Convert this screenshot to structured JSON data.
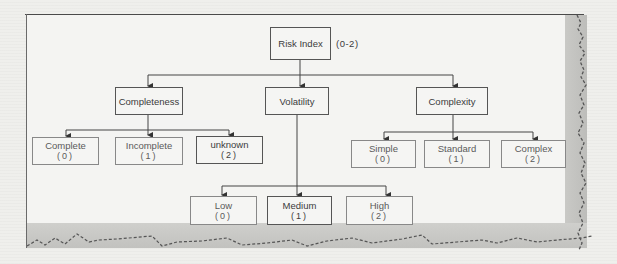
{
  "diagram": {
    "root": {
      "label": "Risk Index",
      "range": "(0-2)"
    },
    "categories": [
      {
        "label": "Completeness",
        "children": [
          {
            "label": "Complete",
            "value": "(0)"
          },
          {
            "label": "Incomplete",
            "value": "(1)"
          },
          {
            "label": "unknown",
            "value": "(2)"
          }
        ]
      },
      {
        "label": "Volatility",
        "children": [
          {
            "label": "Low",
            "value": "(0)"
          },
          {
            "label": "Medium",
            "value": "(1)"
          },
          {
            "label": "High",
            "value": "(2)"
          }
        ]
      },
      {
        "label": "Complexity",
        "children": [
          {
            "label": "Simple",
            "value": "(0)"
          },
          {
            "label": "Standard",
            "value": "(1)"
          },
          {
            "label": "Complex",
            "value": "(2)"
          }
        ]
      }
    ],
    "colors": {
      "line": "#444444",
      "node_border": "#555555",
      "paper": "#f4f4f2",
      "torn_edge_shadow": "#c4c4c1"
    }
  }
}
